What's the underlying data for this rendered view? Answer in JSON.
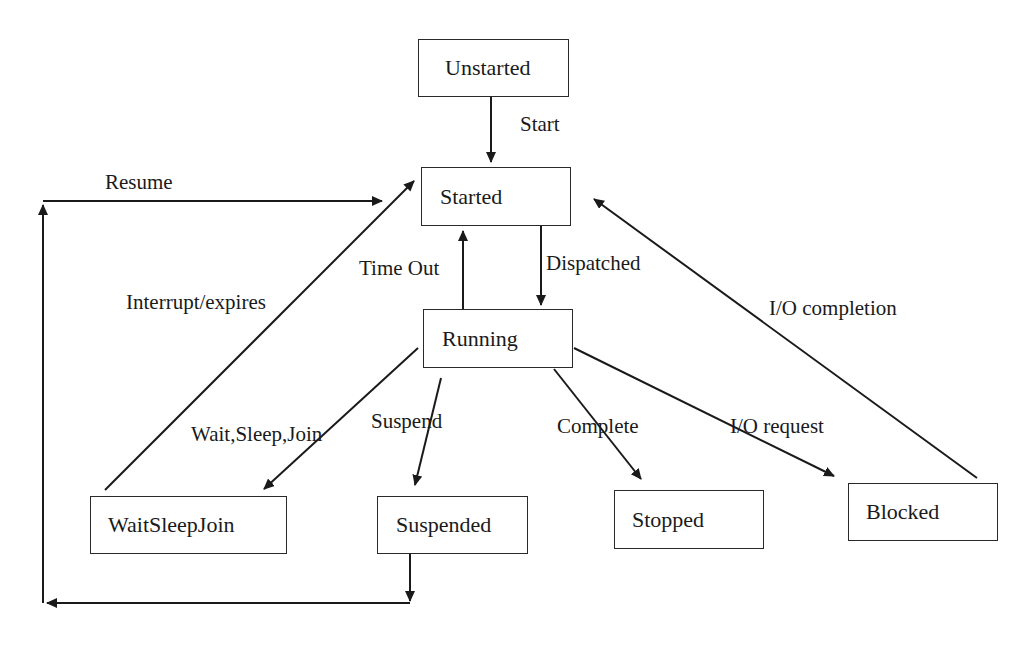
{
  "diagram": {
    "states": [
      {
        "id": "unstarted",
        "label": "Unstarted",
        "x": 418,
        "y": 39,
        "w": 151,
        "h": 58,
        "pad": 26
      },
      {
        "id": "started",
        "label": "Started",
        "x": 421,
        "y": 167,
        "w": 150,
        "h": 59,
        "pad": 18
      },
      {
        "id": "running",
        "label": "Running",
        "x": 423,
        "y": 309,
        "w": 150,
        "h": 59,
        "pad": 18
      },
      {
        "id": "waitsleepjoin",
        "label": "WaitSleepJoin",
        "x": 90,
        "y": 496,
        "w": 197,
        "h": 58,
        "pad": 17
      },
      {
        "id": "suspended",
        "label": "Suspended",
        "x": 377,
        "y": 496,
        "w": 151,
        "h": 58,
        "pad": 18
      },
      {
        "id": "stopped",
        "label": "Stopped",
        "x": 614,
        "y": 490,
        "w": 150,
        "h": 59,
        "pad": 17
      },
      {
        "id": "blocked",
        "label": "Blocked",
        "x": 848,
        "y": 483,
        "w": 150,
        "h": 58,
        "pad": 17
      }
    ],
    "transitions": [
      {
        "id": "start",
        "label": "Start",
        "from": "Unstarted",
        "to": "Started",
        "lx": 520,
        "ly": 114
      },
      {
        "id": "resume",
        "label": "Resume",
        "from": "Suspended",
        "to": "Started",
        "lx": 105,
        "ly": 172
      },
      {
        "id": "interrupt-expires",
        "label": "Interrupt/expires",
        "from": "WaitSleepJoin",
        "to": "Started",
        "lx": 126,
        "ly": 292
      },
      {
        "id": "time-out",
        "label": "Time Out",
        "from": "Running",
        "to": "Started",
        "lx": 359,
        "ly": 258
      },
      {
        "id": "dispatched",
        "label": "Dispatched",
        "from": "Started",
        "to": "Running",
        "lx": 546,
        "ly": 253
      },
      {
        "id": "io-completion",
        "label": "I/O completion",
        "from": "Blocked",
        "to": "Started",
        "lx": 769,
        "ly": 298
      },
      {
        "id": "wait-sleep-join",
        "label": "Wait,Sleep,Join",
        "from": "Running",
        "to": "WaitSleepJoin",
        "lx": 191,
        "ly": 424
      },
      {
        "id": "suspend",
        "label": "Suspend",
        "from": "Running",
        "to": "Suspended",
        "lx": 371,
        "ly": 411
      },
      {
        "id": "complete",
        "label": "Complete",
        "from": "Running",
        "to": "Stopped",
        "lx": 557,
        "ly": 416
      },
      {
        "id": "io-request",
        "label": "I/O request",
        "from": "Running",
        "to": "Blocked",
        "lx": 730,
        "ly": 416
      }
    ]
  }
}
